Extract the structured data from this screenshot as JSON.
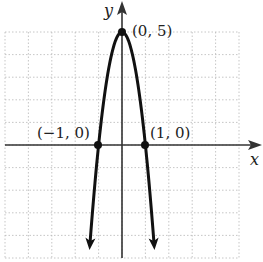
{
  "chart_data": {
    "type": "line",
    "title": "",
    "xlabel": "x",
    "ylabel": "y",
    "equation_implied": "y = 5 - 5x^2",
    "xlim": [
      -5,
      5
    ],
    "ylim": [
      -5,
      5
    ],
    "grid": true,
    "grid_style": "dotted",
    "legend": null,
    "series": [
      {
        "name": "parabola",
        "x": [
          -1.4,
          -1.2,
          -1.0,
          -0.8,
          -0.6,
          -0.4,
          -0.2,
          0.0,
          0.2,
          0.4,
          0.6,
          0.8,
          1.0,
          1.2,
          1.4
        ],
        "y": [
          -4.8,
          -2.2,
          0.0,
          1.8,
          3.2,
          4.2,
          4.8,
          5.0,
          4.8,
          4.2,
          3.2,
          1.8,
          0.0,
          -2.2,
          -4.8
        ],
        "arrows_at_ends": true
      }
    ],
    "annotations": [
      {
        "label": "(0, 5)",
        "x": 0,
        "y": 5,
        "marker": "point"
      },
      {
        "label": "(−1, 0)",
        "x": -1,
        "y": 0,
        "marker": "point"
      },
      {
        "label": "(1, 0)",
        "x": 1,
        "y": 0,
        "marker": "point"
      }
    ]
  },
  "labels": {
    "x_axis": "x",
    "y_axis": "y",
    "vertex": "(0, 5)",
    "left_root": "(−1, 0)",
    "right_root": "(1, 0)"
  },
  "colors": {
    "curve": "#111111",
    "axes": "#333333",
    "grid": "#b8b8b8",
    "background": "#ffffff"
  }
}
